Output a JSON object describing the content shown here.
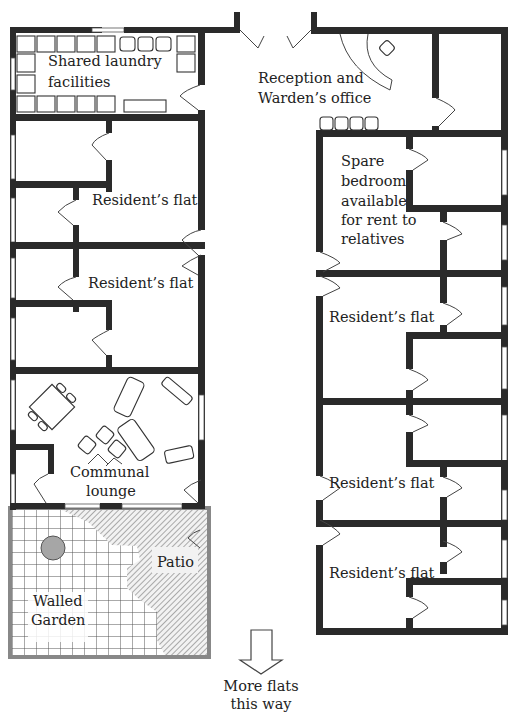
{
  "rooms": {
    "laundry": [
      "Shared laundry",
      "facilities"
    ],
    "reception": [
      "Reception and",
      "Warden’s office"
    ],
    "spare_bedroom": [
      "Spare",
      "bedroom",
      "available",
      "for rent to",
      "relatives"
    ],
    "flat_left_1": "Resident’s flat",
    "flat_left_2": "Resident’s flat",
    "flat_right_1": "Resident’s flat",
    "flat_right_2": "Resident’s flat",
    "flat_right_3": "Resident’s flat",
    "lounge": [
      "Communal",
      "lounge"
    ],
    "patio": "Patio",
    "garden": [
      "Walled",
      "Garden"
    ]
  },
  "direction_note": [
    "More flats",
    "this way"
  ],
  "icons": {
    "direction": "arrow-down-outline",
    "garden_feature": "gray-circle"
  },
  "colors": {
    "wall": "#2a2a2a",
    "garden_feature": "#a6a6a6",
    "hatch": "#777777"
  }
}
